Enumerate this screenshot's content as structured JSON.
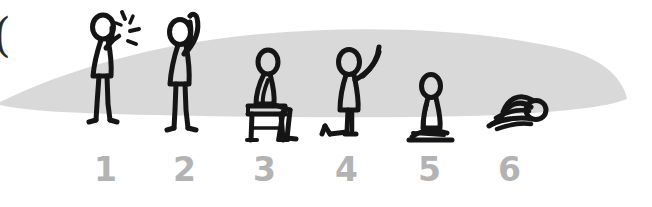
{
  "canvas": {
    "width": 652,
    "height": 207,
    "background": "#ffffff"
  },
  "illustration": {
    "title": "Six-step stick figure prayer posture sequence",
    "style": "hand-drawn-marker",
    "ink_color": "#1a1a1a",
    "blob_color": "#d9d9d9",
    "label_color": "#b3b3b3"
  },
  "ground_blob": {
    "name": "gray-lens-shadow",
    "color": "#d9d9d9",
    "left_x": 0,
    "right_tip_x": 627,
    "peak_y": 30,
    "bottom_y": 116
  },
  "left_edge_mark": {
    "glyph": ")",
    "color": "#2b2b2b"
  },
  "steps": [
    {
      "number": "1",
      "pose": "standing-hands-raised-to-face",
      "description": "standing figure with hand raised beside face, motion lines",
      "has_motion_lines": true,
      "label_x": 94,
      "label_y": 154,
      "figure_cx": 107
    },
    {
      "number": "2",
      "pose": "standing-arms-raised",
      "description": "standing figure with both arms raised upward",
      "has_motion_lines": false,
      "label_x": 173,
      "label_y": 154,
      "figure_cx": 185
    },
    {
      "number": "3",
      "pose": "seated-on-stool",
      "description": "figure seated on a small stool, leaning forward",
      "has_motion_lines": false,
      "label_x": 253,
      "label_y": 154,
      "figure_cx": 266
    },
    {
      "number": "4",
      "pose": "kneeling-one-knee-arm-raised",
      "description": "figure kneeling on one knee with arm raised",
      "has_motion_lines": false,
      "label_x": 335,
      "label_y": 154,
      "figure_cx": 348
    },
    {
      "number": "5",
      "pose": "kneeling-sitting-on-heels",
      "description": "figure kneeling upright sitting back on heels",
      "has_motion_lines": false,
      "label_x": 418,
      "label_y": 154,
      "figure_cx": 430
    },
    {
      "number": "6",
      "pose": "prostrate-bowing",
      "description": "figure prostrate, forehead to the ground",
      "has_motion_lines": false,
      "label_x": 498,
      "label_y": 154,
      "figure_cx": 517
    }
  ]
}
